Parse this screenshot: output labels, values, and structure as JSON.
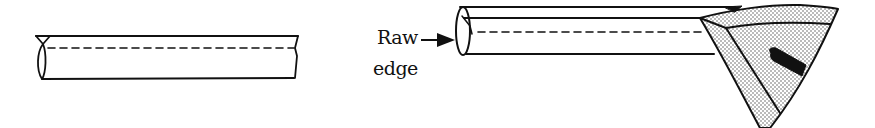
{
  "diagram": {
    "type": "technical-illustration",
    "colors": {
      "line": "#111111",
      "background": "#ffffff",
      "stipple": "#555555"
    },
    "panels": [
      {
        "id": "left",
        "description": "fabric tube with dashed stitching line"
      },
      {
        "id": "right",
        "description": "fabric tube being pressed by iron, raw edge indicated",
        "callout": {
          "label_line1": "Raw",
          "label_line2": "edge"
        }
      }
    ]
  }
}
